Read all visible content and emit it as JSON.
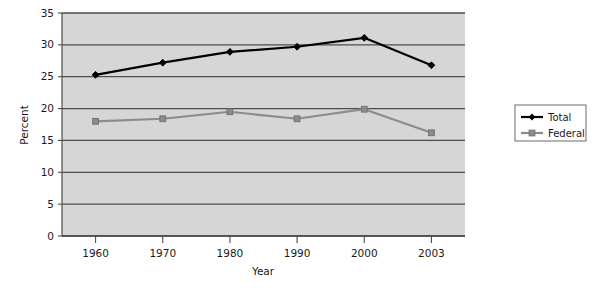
{
  "chart_data": {
    "type": "line",
    "title": "",
    "xlabel": "Year",
    "ylabel": "Percent",
    "categories": [
      "1960",
      "1970",
      "1980",
      "1990",
      "2000",
      "2003"
    ],
    "series": [
      {
        "name": "Total",
        "color": "#000000",
        "marker": "diamond",
        "values": [
          25.3,
          27.2,
          28.9,
          29.7,
          31.1,
          26.8
        ]
      },
      {
        "name": "Federal",
        "color": "#8c8c8c",
        "marker": "square",
        "values": [
          18.0,
          18.4,
          19.5,
          18.4,
          19.9,
          16.2
        ]
      }
    ],
    "ylim": [
      0,
      35
    ],
    "ytick_step": 5,
    "yticks": [
      "0",
      "5",
      "10",
      "15",
      "20",
      "25",
      "30",
      "35"
    ],
    "grid": true,
    "grid_axis": "y",
    "legend_position": "right",
    "plot_background": "#d6d6d6",
    "grid_color": "#4d4d4d",
    "axis_color": "#4d4d4d"
  },
  "legend": {
    "entries": [
      {
        "label": "Total"
      },
      {
        "label": "Federal"
      }
    ]
  }
}
